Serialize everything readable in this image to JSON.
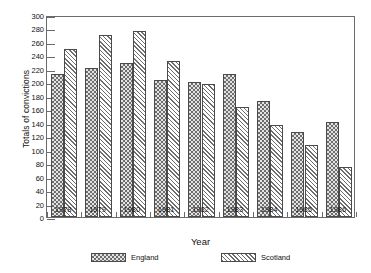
{
  "chart_data": {
    "type": "bar",
    "title": "",
    "subtitle": "",
    "xlabel": "Year",
    "ylabel": "Totals of convictions",
    "categories": [
      "1978",
      "1979",
      "1980",
      "1981",
      "1982",
      "1983",
      "1984",
      "1985",
      "1986"
    ],
    "series": [
      {
        "name": "England",
        "pattern": "cross-hatch-checkerboard",
        "values": [
          213,
          221,
          228,
          204,
          200,
          213,
          172,
          126,
          141
        ]
      },
      {
        "name": "Scotland",
        "pattern": "diagonal-hatch",
        "values": [
          250,
          270,
          276,
          231,
          197,
          164,
          137,
          107,
          75
        ]
      }
    ],
    "ylim": [
      0,
      300
    ],
    "yticks": [
      0,
      20,
      40,
      60,
      80,
      100,
      120,
      140,
      160,
      180,
      200,
      220,
      240,
      260,
      280,
      300
    ],
    "ytick_labels": [
      "0",
      "20",
      "40",
      "60",
      "80",
      "100",
      "120",
      "140",
      "160",
      "180",
      "200",
      "220",
      "240",
      "260",
      "280",
      "300"
    ],
    "grid": false,
    "legend_position": "bottom",
    "legend": [
      "England",
      "Scotland"
    ],
    "colors": {
      "axis": "#6b6b6b",
      "text": "#111111",
      "hatch": "#6e6e6e",
      "england_fill": "#e3e3e3",
      "scotland_fill": "#d8d8d8",
      "background": "#ffffff"
    }
  }
}
